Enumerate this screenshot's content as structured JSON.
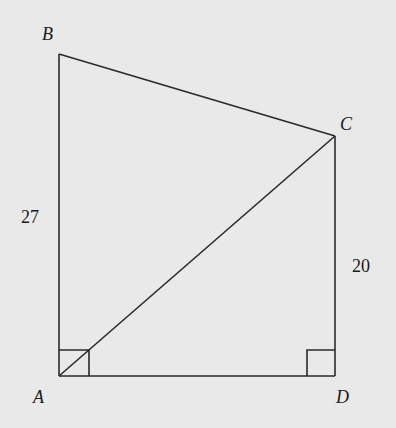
{
  "figure": {
    "type": "geometry-quadrilateral",
    "background": "#e9e9e9",
    "stroke_color": "#2a2a2a",
    "vertices": {
      "A": {
        "label": "A",
        "x": 59,
        "y": 376
      },
      "B": {
        "label": "B",
        "x": 59,
        "y": 54
      },
      "C": {
        "label": "C",
        "x": 335,
        "y": 136
      },
      "D": {
        "label": "D",
        "x": 335,
        "y": 376
      }
    },
    "segments": [
      "AB",
      "BC",
      "CD",
      "DA",
      "AC"
    ],
    "side_labels": {
      "AB": "27",
      "CD": "20"
    },
    "right_angles": [
      "A",
      "D"
    ]
  }
}
